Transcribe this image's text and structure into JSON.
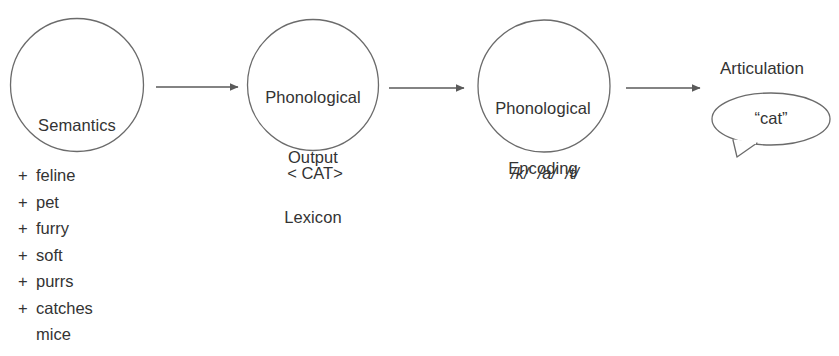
{
  "diagram": {
    "colors": {
      "stroke": "#6b6b6b",
      "arrow": "#5a5a5a",
      "text": "#333333",
      "background": "#ffffff"
    },
    "nodes": [
      {
        "id": "semantics",
        "shape": "circle",
        "label": "Semantics",
        "label_lines": [
          "Semantics"
        ],
        "caption": ""
      },
      {
        "id": "phonological-output-lexicon",
        "shape": "circle",
        "label": "Phonological Output Lexicon",
        "label_lines": [
          "Phonological",
          "Output",
          "Lexicon"
        ],
        "caption": "< CAT>"
      },
      {
        "id": "phonological-encoding",
        "shape": "circle",
        "label": "Phonological Encoding",
        "label_lines": [
          "Phonological",
          "Encoding"
        ],
        "caption": "/k/  /a/  /t/"
      },
      {
        "id": "articulation",
        "shape": "speech-bubble",
        "label": "Articulation",
        "bubble_text": "“cat”"
      }
    ],
    "arrows": [
      {
        "id": "arrow-1",
        "from": "semantics",
        "to": "phonological-output-lexicon"
      },
      {
        "id": "arrow-2",
        "from": "phonological-output-lexicon",
        "to": "phonological-encoding"
      },
      {
        "id": "arrow-3",
        "from": "phonological-encoding",
        "to": "articulation"
      }
    ],
    "semantic_features": [
      {
        "marker": "+",
        "text": "feline",
        "continuation": false
      },
      {
        "marker": "+",
        "text": "pet",
        "continuation": false
      },
      {
        "marker": "+",
        "text": "furry",
        "continuation": false
      },
      {
        "marker": "+",
        "text": "soft",
        "continuation": false
      },
      {
        "marker": "+",
        "text": "purrs",
        "continuation": false
      },
      {
        "marker": "+",
        "text": "catches",
        "continuation": false
      },
      {
        "marker": "",
        "text": "mice",
        "continuation": true
      }
    ]
  }
}
